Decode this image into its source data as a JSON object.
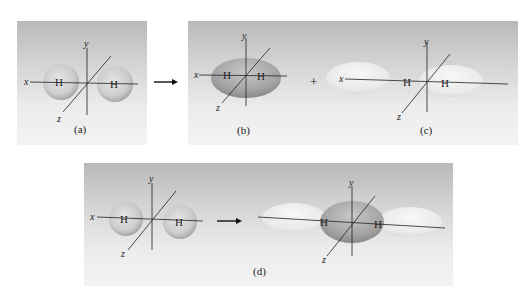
{
  "figure": {
    "panels": [
      {
        "id": "a",
        "caption": "(a)",
        "atom_labels": [
          "H",
          "H"
        ],
        "axis_labels": {
          "x": "x",
          "y": "y",
          "z": "z"
        },
        "description": "two separate spherical 1s orbitals"
      },
      {
        "id": "b",
        "caption": "(b)",
        "atom_labels": [
          "H",
          "H"
        ],
        "axis_labels": {
          "x": "x",
          "y": "y",
          "z": "z"
        },
        "description": "bonding sigma molecular orbital"
      },
      {
        "id": "c",
        "caption": "(c)",
        "atom_labels": [
          "H",
          "H"
        ],
        "axis_labels": {
          "x": "x",
          "y": "y",
          "z": "z"
        },
        "description": "antibonding sigma molecular orbital"
      },
      {
        "id": "d",
        "caption": "(d)",
        "atom_labels": [
          "H",
          "H",
          "H",
          "H"
        ],
        "axis_labels": {
          "x": "x",
          "y": "y",
          "z": "z"
        },
        "description": "combined atomic orbitals forming molecular orbitals"
      }
    ],
    "operators": {
      "plus": "+",
      "arrow_top": "→",
      "arrow_bottom": "→"
    },
    "colors": {
      "panel_top": "#b9b9b9",
      "panel_bottom": "#f3f3f3",
      "orbital_dark": "#a8a8a8",
      "orbital_light": "#f2f2f2",
      "axis": "#222222"
    }
  }
}
